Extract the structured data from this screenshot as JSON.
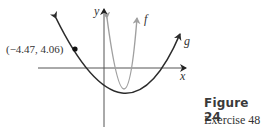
{
  "figure": {
    "title": "Figure 24",
    "subtitle": "Exercise 48"
  },
  "graph": {
    "x_axis_label": "x",
    "y_axis_label": "y",
    "curves": [
      {
        "name": "f",
        "label": "f",
        "color": "#a0a0a0",
        "description": "narrow upward parabola"
      },
      {
        "name": "g",
        "label": "g",
        "color": "#2b2b2b",
        "description": "wide upward parabola"
      }
    ],
    "point": {
      "label": "(−4.47, 4.06)",
      "x": -4.47,
      "y": 4.06
    }
  },
  "colors": {
    "axis": "#555555",
    "f": "#a0a0a0",
    "g": "#2b2b2b"
  }
}
